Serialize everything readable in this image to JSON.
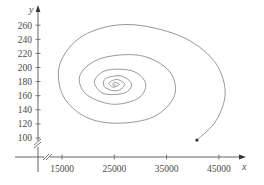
{
  "chart_data": {
    "type": "line",
    "title": "",
    "xlabel": "x",
    "ylabel": "y",
    "x_ticks": [
      15000,
      25000,
      35000,
      45000
    ],
    "y_ticks": [
      100,
      120,
      140,
      160,
      180,
      200,
      220,
      240,
      260
    ],
    "xlim": [
      10000,
      49000
    ],
    "ylim": [
      70,
      275
    ],
    "grid": false,
    "legend": null,
    "axis_breaks": {
      "x": true,
      "y": true
    },
    "series": [
      {
        "name": "trajectory",
        "start_point": {
          "x": 40800,
          "y": 97
        },
        "equilibrium_center": {
          "x": 25100,
          "y": 176
        },
        "points": [
          {
            "x": 40800,
            "y": 97
          },
          {
            "x": 44500,
            "y": 125
          },
          {
            "x": 46200,
            "y": 166
          },
          {
            "x": 44000,
            "y": 210
          },
          {
            "x": 37500,
            "y": 245
          },
          {
            "x": 27400,
            "y": 261
          },
          {
            "x": 19000,
            "y": 245
          },
          {
            "x": 14600,
            "y": 205
          },
          {
            "x": 15200,
            "y": 160
          },
          {
            "x": 19500,
            "y": 130
          },
          {
            "x": 25500,
            "y": 121
          },
          {
            "x": 32500,
            "y": 130
          },
          {
            "x": 36500,
            "y": 160
          },
          {
            "x": 35500,
            "y": 195
          },
          {
            "x": 30000,
            "y": 217
          },
          {
            "x": 22500,
            "y": 213
          },
          {
            "x": 18500,
            "y": 190
          },
          {
            "x": 19500,
            "y": 163
          },
          {
            "x": 24500,
            "y": 148
          },
          {
            "x": 29500,
            "y": 156
          },
          {
            "x": 31000,
            "y": 177
          },
          {
            "x": 28500,
            "y": 195
          },
          {
            "x": 23500,
            "y": 196
          },
          {
            "x": 21200,
            "y": 180
          },
          {
            "x": 23000,
            "y": 163
          },
          {
            "x": 27000,
            "y": 164
          },
          {
            "x": 28300,
            "y": 177
          },
          {
            "x": 26200,
            "y": 188
          },
          {
            "x": 23300,
            "y": 184
          },
          {
            "x": 23200,
            "y": 172
          },
          {
            "x": 25500,
            "y": 167
          },
          {
            "x": 27000,
            "y": 176
          },
          {
            "x": 25500,
            "y": 183
          },
          {
            "x": 24000,
            "y": 178
          },
          {
            "x": 24800,
            "y": 172
          },
          {
            "x": 25900,
            "y": 176
          },
          {
            "x": 25100,
            "y": 179
          },
          {
            "x": 24700,
            "y": 176
          },
          {
            "x": 25100,
            "y": 174
          },
          {
            "x": 25100,
            "y": 176
          }
        ]
      }
    ]
  },
  "axes": {
    "x_label": "x",
    "y_label": "y",
    "x_tick_labels": [
      "15000",
      "25000",
      "35000",
      "45000"
    ],
    "y_tick_labels": [
      "260",
      "240",
      "220",
      "200",
      "180",
      "160",
      "140",
      "120",
      "100"
    ]
  },
  "style": {
    "curve_color": "#8c8c8c",
    "axis_color": "#555555",
    "text_color": "#4a4a4a",
    "marker_color": "#333333"
  }
}
